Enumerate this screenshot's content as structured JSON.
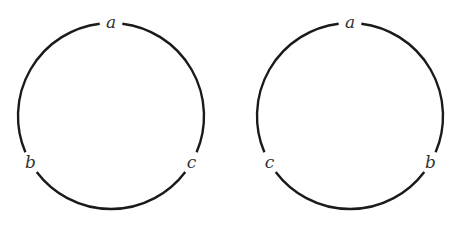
{
  "figure": {
    "type": "two labeled cyclic orderings",
    "stroke_color": "#1a1a1a",
    "label_color": "#333333",
    "circles": [
      {
        "id": "left",
        "center": [
          111,
          116
        ],
        "radius": 93,
        "labels": [
          {
            "text": "a",
            "position": "top",
            "angle_deg": 90
          },
          {
            "text": "b",
            "position": "lower-left",
            "angle_deg": 210
          },
          {
            "text": "c",
            "position": "lower-right",
            "angle_deg": 330
          }
        ]
      },
      {
        "id": "right",
        "center": [
          350,
          116
        ],
        "radius": 93,
        "labels": [
          {
            "text": "a",
            "position": "top",
            "angle_deg": 90
          },
          {
            "text": "c",
            "position": "lower-left",
            "angle_deg": 210
          },
          {
            "text": "b",
            "position": "lower-right",
            "angle_deg": 330
          }
        ]
      }
    ]
  }
}
